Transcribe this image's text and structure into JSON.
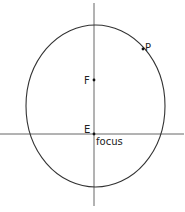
{
  "diagram": {
    "type": "orbit-ellipse",
    "colors": {
      "stroke": "#333333",
      "axis": "#555555",
      "background": "#ffffff"
    },
    "ellipse": {
      "cx": 95.5,
      "cy": 106,
      "rx": 69.5,
      "ry": 81
    },
    "axes": {
      "vertical": {
        "x": 94,
        "y1": 3,
        "y2": 206
      },
      "horizontal": {
        "y": 134,
        "x1": 0,
        "x2": 184
      }
    },
    "points": [
      {
        "id": "F",
        "label": "F",
        "x": 94,
        "y": 80
      },
      {
        "id": "E",
        "label": "E",
        "x": 94,
        "y": 134
      },
      {
        "id": "P",
        "label": "P",
        "x": 143,
        "y": 49
      }
    ],
    "annotations": {
      "focus_label": "focus"
    }
  }
}
